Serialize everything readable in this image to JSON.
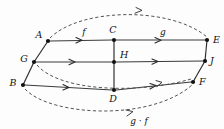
{
  "diagram": {
    "type": "commutative-diagram",
    "background_color": "#fdfdfd",
    "ink_color": "#111111",
    "nodes": [
      {
        "id": "A",
        "label": "A",
        "x": 48,
        "y": 41,
        "label_dx": -9,
        "label_dy": -3
      },
      {
        "id": "G",
        "label": "G",
        "x": 34,
        "y": 62,
        "label_dx": -10,
        "label_dy": 0
      },
      {
        "id": "B",
        "label": "B",
        "x": 23,
        "y": 85,
        "label_dx": -10,
        "label_dy": 1
      },
      {
        "id": "C",
        "label": "C",
        "x": 114,
        "y": 40,
        "label_dx": -2,
        "label_dy": -5
      },
      {
        "id": "H",
        "label": "H",
        "x": 114,
        "y": 62,
        "label_dx": 4,
        "label_dy": -3
      },
      {
        "id": "D",
        "label": "D",
        "x": 114,
        "y": 90,
        "label_dx": -2,
        "label_dy": 12
      },
      {
        "id": "E",
        "label": "E",
        "x": 207,
        "y": 40,
        "label_dx": 5,
        "label_dy": 2
      },
      {
        "id": "J",
        "label": "J",
        "x": 205,
        "y": 61,
        "label_dx": 5,
        "label_dy": 2
      },
      {
        "id": "F",
        "label": "F",
        "x": 193,
        "y": 82,
        "label_dx": 5,
        "label_dy": 2
      }
    ],
    "edge_labels": [
      {
        "id": "f",
        "text": "f",
        "x": 84,
        "y": 35
      },
      {
        "id": "g",
        "text": "g",
        "x": 163,
        "y": 35
      },
      {
        "id": "gf",
        "text": "g · f",
        "x": 139,
        "y": 122
      }
    ],
    "solid_edges": [
      {
        "from": "A",
        "to": "C",
        "label": "f"
      },
      {
        "from": "C",
        "to": "E",
        "label": "g"
      },
      {
        "from": "G",
        "to": "H",
        "label": ""
      },
      {
        "from": "H",
        "to": "J",
        "label": ""
      },
      {
        "from": "B",
        "to": "D",
        "label": ""
      },
      {
        "from": "D",
        "to": "F",
        "label": ""
      }
    ],
    "frame_edges": [
      {
        "from": "A",
        "to": "B",
        "label": ""
      },
      {
        "from": "C",
        "to": "D",
        "label": ""
      },
      {
        "from": "E",
        "to": "F",
        "label": ""
      }
    ],
    "dashed_arcs": [
      {
        "id": "top-arc",
        "from": "A",
        "to": "E",
        "label": ""
      },
      {
        "id": "middle-arc",
        "from": "G",
        "to": "F",
        "label": ""
      },
      {
        "id": "bottom-arc",
        "from": "B",
        "to": "F",
        "label": "g · f"
      }
    ]
  }
}
